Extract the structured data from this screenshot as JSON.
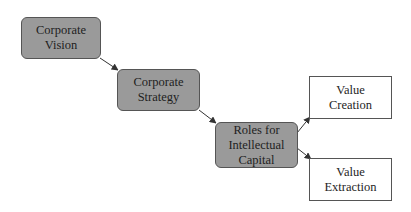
{
  "diagram": {
    "type": "flowchart",
    "colors": {
      "shaded_fill": "#9a9a9a",
      "plain_fill": "#ffffff",
      "border": "#555555",
      "edge": "#333333"
    },
    "nodes": [
      {
        "id": "vision",
        "label": "Corporate\nVision",
        "style": "shaded"
      },
      {
        "id": "strategy",
        "label": "Corporate\nStrategy",
        "style": "shaded"
      },
      {
        "id": "roles",
        "label": "Roles for\nIntellectual\nCapital",
        "style": "shaded"
      },
      {
        "id": "creation",
        "label": "Value\nCreation",
        "style": "plain"
      },
      {
        "id": "extraction",
        "label": "Value\nExtraction",
        "style": "plain"
      }
    ],
    "edges": [
      {
        "from": "vision",
        "to": "strategy"
      },
      {
        "from": "strategy",
        "to": "roles"
      },
      {
        "from": "roles",
        "to": "creation"
      },
      {
        "from": "roles",
        "to": "extraction"
      }
    ]
  }
}
